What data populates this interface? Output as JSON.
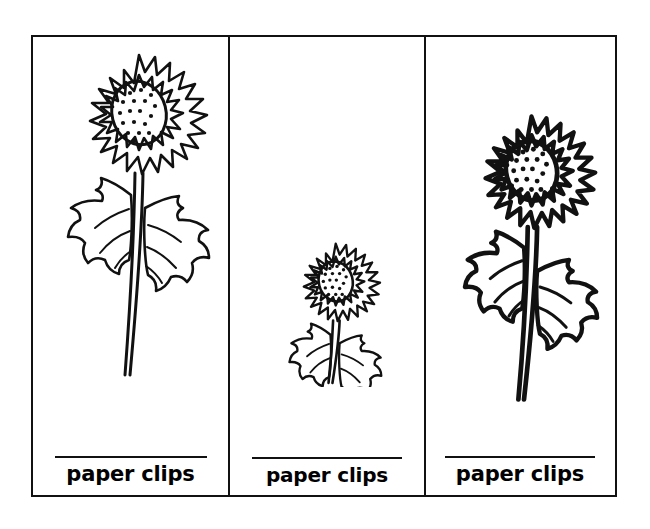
{
  "page": {
    "background_color": "#ffffff",
    "ink_color": "#111111",
    "width": 650,
    "height": 529
  },
  "frame": {
    "name": "three-card-strip",
    "border_color": "#111111"
  },
  "cards": [
    {
      "id": "card-large-sunflower",
      "illustration": "sunflower-flower-icon",
      "illustration_size": "large",
      "write_line": "",
      "label": "paper clips"
    },
    {
      "id": "card-small-sunflower",
      "illustration": "sunflower-flower-icon",
      "illustration_size": "small",
      "write_line": "",
      "label": "paper clips"
    },
    {
      "id": "card-medium-sunflower",
      "illustration": "sunflower-flower-icon",
      "illustration_size": "medium-bold",
      "write_line": "",
      "label": "paper clips"
    }
  ]
}
